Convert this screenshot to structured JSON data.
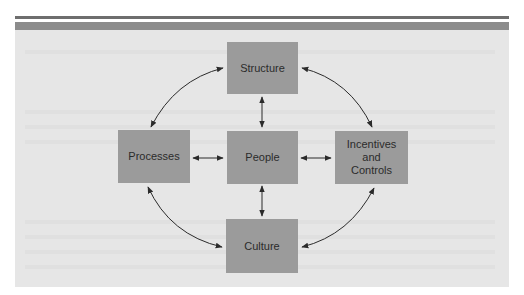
{
  "diagram": {
    "nodes": {
      "structure": {
        "label": "Structure"
      },
      "processes": {
        "label": "Processes"
      },
      "people": {
        "label": "People"
      },
      "incentives": {
        "label_line1": "Incentives",
        "label_line2": "and",
        "label_line3": "Controls"
      },
      "culture": {
        "label": "Culture"
      }
    },
    "edges": [
      {
        "from": "Structure",
        "to": "People",
        "type": "bidirectional-straight"
      },
      {
        "from": "People",
        "to": "Culture",
        "type": "bidirectional-straight"
      },
      {
        "from": "Processes",
        "to": "People",
        "type": "bidirectional-straight"
      },
      {
        "from": "People",
        "to": "Incentives and Controls",
        "type": "bidirectional-straight"
      },
      {
        "from": "Processes",
        "to": "Structure",
        "type": "bidirectional-curved"
      },
      {
        "from": "Structure",
        "to": "Incentives and Controls",
        "type": "bidirectional-curved"
      },
      {
        "from": "Processes",
        "to": "Culture",
        "type": "bidirectional-curved"
      },
      {
        "from": "Culture",
        "to": "Incentives and Controls",
        "type": "bidirectional-curved"
      }
    ],
    "colors": {
      "box_fill": "#9b9b9b",
      "panel_fill": "#e6e6e6",
      "arrow": "#2b2b2b",
      "rule": "#6e6e6e",
      "band": "#8c8c8c"
    }
  }
}
